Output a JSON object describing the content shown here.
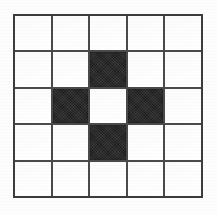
{
  "figure": {
    "rows": 5,
    "columns": 5,
    "colors": {
      "filled": "#1e1e1e",
      "empty": "#ffffff",
      "gridline": "#4a4a4a",
      "border": "#3c3c3c",
      "background": "#fdfdfd"
    },
    "geometry": {
      "left": 13,
      "top": 14,
      "width": 190,
      "height": 184,
      "cell_width": 38,
      "cell_height": 37,
      "line_thickness": 2
    }
  },
  "chart_data": {
    "type": "heatmap",
    "xlabel": "",
    "ylabel": "",
    "grid": true,
    "legend": "none",
    "categories_x": [
      "c1",
      "c2",
      "c3",
      "c4",
      "c5"
    ],
    "categories_y": [
      "r1",
      "r2",
      "r3",
      "r4",
      "r5"
    ],
    "value_labels": {
      "0": "white",
      "1": "black"
    },
    "values": [
      [
        0,
        0,
        0,
        0,
        0
      ],
      [
        0,
        0,
        1,
        0,
        0
      ],
      [
        0,
        1,
        0,
        1,
        0
      ],
      [
        0,
        0,
        1,
        0,
        0
      ],
      [
        0,
        0,
        0,
        0,
        0
      ]
    ],
    "filled_count": 4,
    "empty_count": 21,
    "pattern_name": "plus"
  }
}
